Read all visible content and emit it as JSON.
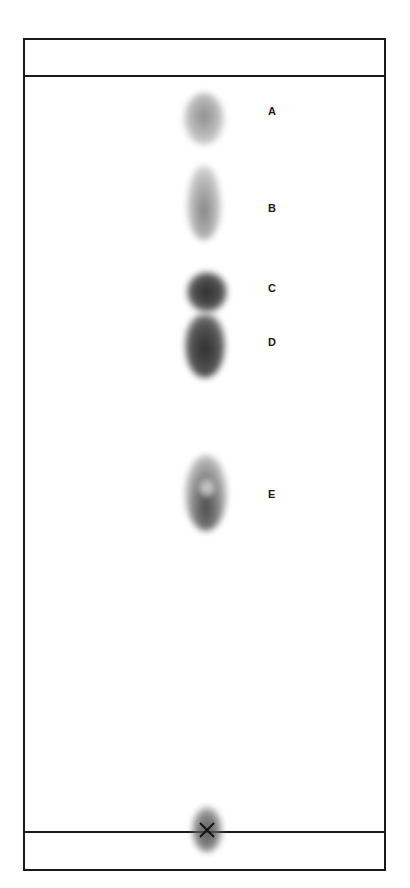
{
  "figure": {
    "type": "thin-layer chromatogram",
    "origin_marker": "×",
    "spots": [
      {
        "label": "A",
        "intensity": "light"
      },
      {
        "label": "B",
        "intensity": "light"
      },
      {
        "label": "C",
        "intensity": "dark"
      },
      {
        "label": "D",
        "intensity": "dark"
      },
      {
        "label": "E",
        "intensity": "medium"
      }
    ],
    "lines": {
      "solvent_front": "solvent-front-line",
      "baseline": "origin-baseline"
    },
    "colors": {
      "outline": "#1a1a1a",
      "spot_light": "#9a9a9a",
      "spot_medium": "#6a6a6a",
      "spot_dark": "#2e2e2e",
      "background": "#ffffff"
    }
  }
}
